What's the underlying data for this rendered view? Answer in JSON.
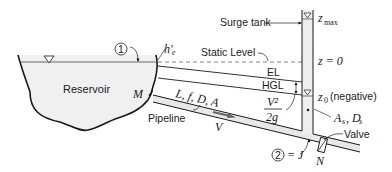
{
  "labels": {
    "surge_tank": "Surge tank",
    "z_max": "z",
    "z_max_sub": "max",
    "z_zero": "z = 0",
    "static_level": "Static Level",
    "el": "EL",
    "hgl": "HGL",
    "z0": "z",
    "z0_sub": "0",
    "z0_note": "(negative)",
    "reservoir": "Reservoir",
    "point_1": "1",
    "h_e": "h′",
    "h_e_sub": "e",
    "point_m": "M",
    "pipe_params": "L, f, D, A",
    "pipeline": "Pipeline",
    "velocity": "V",
    "velocity_head_num": "V²",
    "velocity_head_den": "2g",
    "tank_params": "A",
    "tank_params_s1": "s",
    "tank_params_d": ", D",
    "tank_params_s2": "s",
    "valve": "Valve",
    "point_2": "2",
    "point_j": "= J",
    "point_n": "N"
  },
  "colors": {
    "line": "#1a1a1a",
    "reservoir_fill": "#f0f0f0",
    "pipe_fill": "#e8e8e8",
    "tank_fill": "#eeeeee"
  }
}
